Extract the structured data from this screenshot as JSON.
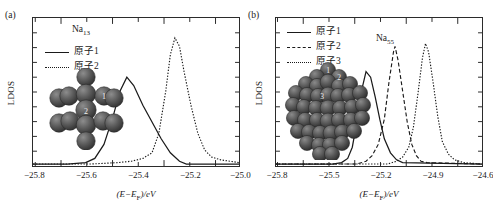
{
  "figure": {
    "panels": [
      {
        "tag": "(a)",
        "species_label": "Na",
        "species_sub": "13",
        "xlabel": "(E−EF)/eV",
        "xlabel_parts": {
          "prefix": "(E−E",
          "sub": "F",
          "suffix": ")/eV"
        },
        "ylabel": "LDOS",
        "legend": [
          {
            "label": "原子1",
            "style": "solid"
          },
          {
            "label": "原子2",
            "style": "dotted"
          }
        ],
        "xticks": [
          "−25.8",
          "−25.6",
          "−25.4",
          "−25.2",
          "−25.0"
        ],
        "cluster_atom_labels": [
          "1",
          "2"
        ]
      },
      {
        "tag": "(b)",
        "species_label": "Na",
        "species_sub": "55",
        "xlabel": "(E−EF)/eV",
        "xlabel_parts": {
          "prefix": "(E−E",
          "sub": "F",
          "suffix": ")/eV"
        },
        "ylabel": "LDOS",
        "legend": [
          {
            "label": "原子1",
            "style": "solid"
          },
          {
            "label": "原子2",
            "style": "dashed"
          },
          {
            "label": "原子3",
            "style": "dotted"
          }
        ],
        "xticks": [
          "−25.8",
          "−25.5",
          "−25.2",
          "−24.9",
          "−24.6"
        ],
        "cluster_atom_labels": [
          "1",
          "2",
          "3"
        ]
      }
    ]
  },
  "chart_data": [
    {
      "type": "line",
      "panel": "(a)",
      "title": "Na13",
      "xlabel": "(E-E_F)/eV",
      "ylabel": "LDOS",
      "xlim": [
        -25.85,
        -24.95
      ],
      "ylim": [
        0,
        1.0
      ],
      "xticks": [
        -25.8,
        -25.6,
        -25.4,
        -25.2,
        -25.0
      ],
      "grid": false,
      "legend_position": "upper-left",
      "series": [
        {
          "name": "原子1",
          "style": "solid",
          "peak_x": -25.44,
          "peak_y": 0.62,
          "points": [
            [
              -25.85,
              0.0
            ],
            [
              -25.7,
              0.0
            ],
            [
              -25.62,
              0.01
            ],
            [
              -25.58,
              0.04
            ],
            [
              -25.54,
              0.14
            ],
            [
              -25.5,
              0.34
            ],
            [
              -25.47,
              0.52
            ],
            [
              -25.44,
              0.62
            ],
            [
              -25.41,
              0.56
            ],
            [
              -25.37,
              0.42
            ],
            [
              -25.33,
              0.3
            ],
            [
              -25.29,
              0.18
            ],
            [
              -25.25,
              0.08
            ],
            [
              -25.21,
              0.02
            ],
            [
              -25.18,
              0.0
            ],
            [
              -24.95,
              0.0
            ]
          ]
        },
        {
          "name": "原子2",
          "style": "dotted",
          "peak_x": -25.23,
          "peak_y": 0.9,
          "points": [
            [
              -25.85,
              0.0
            ],
            [
              -25.6,
              0.0
            ],
            [
              -25.48,
              0.01
            ],
            [
              -25.42,
              0.02
            ],
            [
              -25.37,
              0.04
            ],
            [
              -25.33,
              0.08
            ],
            [
              -25.3,
              0.22
            ],
            [
              -25.27,
              0.52
            ],
            [
              -25.25,
              0.78
            ],
            [
              -25.23,
              0.9
            ],
            [
              -25.21,
              0.84
            ],
            [
              -25.19,
              0.66
            ],
            [
              -25.16,
              0.42
            ],
            [
              -25.13,
              0.22
            ],
            [
              -25.1,
              0.1
            ],
            [
              -25.07,
              0.05
            ],
            [
              -25.03,
              0.03
            ],
            [
              -24.99,
              0.02
            ],
            [
              -24.95,
              0.01
            ]
          ]
        }
      ]
    },
    {
      "type": "line",
      "panel": "(b)",
      "title": "Na55",
      "xlabel": "(E-E_F)/eV",
      "ylabel": "LDOS",
      "xlim": [
        -25.85,
        -24.5
      ],
      "ylim": [
        0,
        1.0
      ],
      "xticks": [
        -25.8,
        -25.5,
        -25.2,
        -24.9,
        -24.6
      ],
      "grid": false,
      "legend_position": "upper-left",
      "series": [
        {
          "name": "原子1",
          "style": "solid",
          "peak_x": -25.26,
          "peak_y": 0.66,
          "points": [
            [
              -25.85,
              0.0
            ],
            [
              -25.48,
              0.0
            ],
            [
              -25.42,
              0.01
            ],
            [
              -25.38,
              0.04
            ],
            [
              -25.35,
              0.12
            ],
            [
              -25.32,
              0.3
            ],
            [
              -25.29,
              0.52
            ],
            [
              -25.26,
              0.66
            ],
            [
              -25.23,
              0.62
            ],
            [
              -25.2,
              0.48
            ],
            [
              -25.17,
              0.32
            ],
            [
              -25.14,
              0.18
            ],
            [
              -25.1,
              0.08
            ],
            [
              -25.06,
              0.03
            ],
            [
              -25.02,
              0.01
            ],
            [
              -24.5,
              0.0
            ]
          ]
        },
        {
          "name": "原子2",
          "style": "dashed",
          "peak_x": -25.07,
          "peak_y": 0.84,
          "points": [
            [
              -25.85,
              0.0
            ],
            [
              -25.32,
              0.0
            ],
            [
              -25.26,
              0.02
            ],
            [
              -25.22,
              0.06
            ],
            [
              -25.18,
              0.14
            ],
            [
              -25.14,
              0.32
            ],
            [
              -25.11,
              0.58
            ],
            [
              -25.08,
              0.8
            ],
            [
              -25.07,
              0.84
            ],
            [
              -25.05,
              0.74
            ],
            [
              -25.02,
              0.52
            ],
            [
              -24.99,
              0.3
            ],
            [
              -24.96,
              0.14
            ],
            [
              -24.93,
              0.06
            ],
            [
              -24.9,
              0.02
            ],
            [
              -24.86,
              0.01
            ],
            [
              -24.5,
              0.0
            ]
          ]
        },
        {
          "name": "原子3",
          "style": "dotted",
          "peak_x": -24.87,
          "peak_y": 0.86,
          "points": [
            [
              -25.85,
              0.0
            ],
            [
              -25.12,
              0.0
            ],
            [
              -25.06,
              0.02
            ],
            [
              -25.02,
              0.05
            ],
            [
              -24.98,
              0.12
            ],
            [
              -24.95,
              0.26
            ],
            [
              -24.92,
              0.5
            ],
            [
              -24.89,
              0.76
            ],
            [
              -24.87,
              0.86
            ],
            [
              -24.85,
              0.8
            ],
            [
              -24.82,
              0.58
            ],
            [
              -24.79,
              0.34
            ],
            [
              -24.76,
              0.16
            ],
            [
              -24.72,
              0.07
            ],
            [
              -24.68,
              0.03
            ],
            [
              -24.62,
              0.01
            ],
            [
              -24.5,
              0.0
            ]
          ]
        }
      ]
    }
  ]
}
